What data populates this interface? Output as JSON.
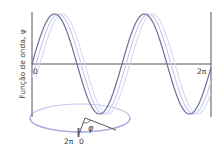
{
  "diagram": {
    "ylabel": "Função de onda, ψ",
    "x_tick_start": "0",
    "x_tick_end": "2π",
    "phase_label": "φ",
    "circle_label_left": "2π",
    "circle_label_right": "0",
    "colors": {
      "axis": "#555555",
      "wave_main": "#6a6f9a",
      "wave_light": "#c4c8e8",
      "circle": "#b9bde6",
      "text": "#333333"
    }
  },
  "chart_data": {
    "type": "line",
    "title": "",
    "xlabel": "",
    "ylabel": "Função de onda, ψ",
    "x_ticks": [
      "0",
      "2π"
    ],
    "series": [
      {
        "name": "wave (reference)",
        "function": "sin",
        "cycles_in_range": 2,
        "phase": 0
      },
      {
        "name": "wave (shifted)",
        "function": "sin",
        "cycles_in_range": 2,
        "phase": "φ"
      }
    ],
    "annotations": [
      "phase circle with angle φ, marks 2π|0"
    ]
  }
}
